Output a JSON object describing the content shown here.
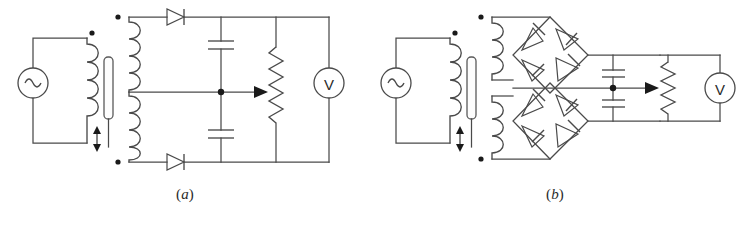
{
  "figure": {
    "background_color": "#ffffff",
    "line_color": "#4a4a4a",
    "mark_color": "#1a1a1a"
  },
  "panels": [
    {
      "id": "a",
      "caption": "(a)",
      "caption_open": "(",
      "caption_letter": "a",
      "caption_close": ")",
      "rectifier_type": "center-tapped full-wave",
      "components": {
        "ac_source": {
          "name": "ac-source",
          "symbol": "sine-wave"
        },
        "transformer": {
          "name": "variable-coupling-transformer",
          "primary_label": "primary-winding",
          "secondary_label": "center-tapped-secondary-winding",
          "core": "adjustable-core",
          "adjust_indicator": "double-headed-arrow",
          "polarity_dots": 3
        },
        "diodes": [
          {
            "name": "diode-top",
            "orientation": "right"
          },
          {
            "name": "diode-bottom",
            "orientation": "right"
          }
        ],
        "capacitors": [
          {
            "name": "filter-capacitor-upper"
          },
          {
            "name": "filter-capacitor-lower"
          }
        ],
        "potentiometer": {
          "name": "output-potentiometer",
          "wiper": "arrow-right"
        },
        "voltmeter": {
          "name": "voltmeter",
          "label": "V"
        },
        "center_tap_node": {
          "name": "center-tap-junction"
        }
      }
    },
    {
      "id": "b",
      "caption": "(b)",
      "caption_open": "(",
      "caption_letter": "b",
      "caption_close": ")",
      "rectifier_type": "dual bridge rectifier",
      "components": {
        "ac_source": {
          "name": "ac-source",
          "symbol": "sine-wave"
        },
        "transformer": {
          "name": "variable-coupling-transformer",
          "primary_label": "primary-winding",
          "secondary_label": "dual-secondary-windings",
          "core": "adjustable-core",
          "adjust_indicator": "double-headed-arrow",
          "polarity_dots": 3
        },
        "bridges": [
          {
            "name": "bridge-rectifier-upper",
            "diode_count": 4
          },
          {
            "name": "bridge-rectifier-lower",
            "diode_count": 4
          }
        ],
        "capacitors": [
          {
            "name": "filter-capacitor-upper"
          },
          {
            "name": "filter-capacitor-lower"
          }
        ],
        "potentiometer": {
          "name": "output-potentiometer",
          "wiper": "arrow-right"
        },
        "voltmeter": {
          "name": "voltmeter",
          "label": "V"
        },
        "center_tap_node": {
          "name": "center-tap-junction"
        }
      }
    }
  ],
  "labels": {
    "voltmeter_symbol": "V",
    "caption_a": "(a)",
    "caption_b": "(b)"
  }
}
